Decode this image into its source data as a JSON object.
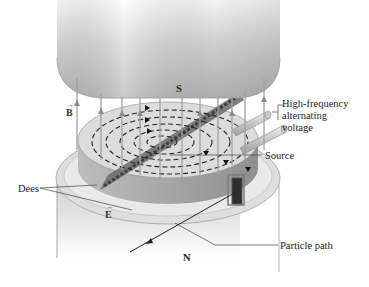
{
  "figure": {
    "labels": {
      "magnet_top": "S",
      "magnet_bottom": "N",
      "magnetic_field": "B",
      "electric_field": "E",
      "voltage": [
        "High-frequency",
        "alternating",
        "voltage"
      ],
      "source": "Source",
      "dees": "Dees",
      "particle_path": "Particle path"
    }
  },
  "colors": {
    "magnet_light": "#f2f2f2",
    "magnet_dark": "#bdbdbd",
    "field_line": "#9a9a9a",
    "dee_face": "#d9d9d9",
    "dee_side": "#a8a8a8",
    "path_dash": "#222222",
    "leader": "#333333"
  }
}
